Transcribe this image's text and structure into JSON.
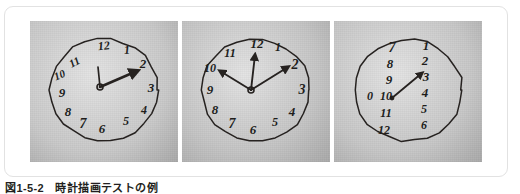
{
  "figure": {
    "caption": "図1-5-2　時計描画テストの例",
    "card_border_color": "#e2e2e2",
    "card_background": "#ffffff",
    "ink_color": "#262220"
  },
  "panels": [
    {
      "id": "clock-drawing-1",
      "label": "clock-drawing-panel-1",
      "description": "手描きの時計 数字が上部左に偏る例",
      "paper_tone": "#c9c9c9",
      "numbers": [
        {
          "text": "12",
          "x": 74,
          "y": 26,
          "size": 12,
          "rot": -6
        },
        {
          "text": "1",
          "x": 97,
          "y": 30,
          "size": 12,
          "rot": -4
        },
        {
          "text": "2",
          "x": 113,
          "y": 44,
          "size": 13,
          "rot": 0
        },
        {
          "text": "3",
          "x": 121,
          "y": 68,
          "size": 13,
          "rot": 0
        },
        {
          "text": "4",
          "x": 114,
          "y": 90,
          "size": 12,
          "rot": 0
        },
        {
          "text": "5",
          "x": 96,
          "y": 101,
          "size": 12,
          "rot": 0
        },
        {
          "text": "6",
          "x": 72,
          "y": 109,
          "size": 13,
          "rot": 0
        },
        {
          "text": "7",
          "x": 53,
          "y": 104,
          "size": 14,
          "rot": 0
        },
        {
          "text": "8",
          "x": 38,
          "y": 92,
          "size": 13,
          "rot": 0
        },
        {
          "text": "9",
          "x": 32,
          "y": 73,
          "size": 13,
          "rot": 0
        },
        {
          "text": "10",
          "x": 30,
          "y": 55,
          "size": 11,
          "rot": -22
        },
        {
          "text": "11",
          "x": 45,
          "y": 42,
          "size": 11,
          "rot": -28
        }
      ],
      "hands": [
        {
          "name": "short-hand",
          "to_x": 68,
          "to_y": 46,
          "width": 1.7,
          "arrow": false
        },
        {
          "name": "long-hand",
          "to_x": 107,
          "to_y": 50,
          "width": 2.6,
          "arrow": true
        }
      ],
      "center": {
        "x": 70,
        "y": 66
      }
    },
    {
      "id": "clock-drawing-2",
      "label": "clock-drawing-panel-2",
      "description": "手描きの時計 3本の針が描かれた例",
      "paper_tone": "#c4c4c4",
      "numbers": [
        {
          "text": "12",
          "x": 75,
          "y": 24,
          "size": 13,
          "rot": 0
        },
        {
          "text": "1",
          "x": 96,
          "y": 27,
          "size": 12,
          "rot": 0
        },
        {
          "text": "2",
          "x": 113,
          "y": 45,
          "size": 14,
          "rot": 0
        },
        {
          "text": "3",
          "x": 120,
          "y": 70,
          "size": 14,
          "rot": 0
        },
        {
          "text": "4",
          "x": 110,
          "y": 92,
          "size": 13,
          "rot": 0
        },
        {
          "text": "5",
          "x": 93,
          "y": 102,
          "size": 12,
          "rot": 0
        },
        {
          "text": "6",
          "x": 71,
          "y": 110,
          "size": 13,
          "rot": 0
        },
        {
          "text": "7",
          "x": 50,
          "y": 104,
          "size": 14,
          "rot": 0
        },
        {
          "text": "8",
          "x": 33,
          "y": 90,
          "size": 13,
          "rot": 0
        },
        {
          "text": "9",
          "x": 28,
          "y": 70,
          "size": 13,
          "rot": 0
        },
        {
          "text": "10",
          "x": 28,
          "y": 48,
          "size": 12,
          "rot": 0
        },
        {
          "text": "11",
          "x": 48,
          "y": 33,
          "size": 12,
          "rot": 0
        }
      ],
      "hands": [
        {
          "name": "hand-to-12",
          "to_x": 73,
          "to_y": 34,
          "width": 1.9,
          "arrow": true
        },
        {
          "name": "hand-to-10",
          "to_x": 38,
          "to_y": 50,
          "width": 1.9,
          "arrow": true
        },
        {
          "name": "hand-to-2",
          "to_x": 106,
          "to_y": 46,
          "width": 2.0,
          "arrow": true
        }
      ],
      "center": {
        "x": 69,
        "y": 69
      }
    },
    {
      "id": "clock-drawing-3",
      "label": "clock-drawing-panel-3",
      "description": "手描きの時計 数字が2列に縦並びになった例",
      "paper_tone": "#c7c7c7",
      "numbers": [
        {
          "text": "7",
          "x": 58,
          "y": 28,
          "size": 14,
          "rot": 0
        },
        {
          "text": "8",
          "x": 56,
          "y": 44,
          "size": 13,
          "rot": 0
        },
        {
          "text": "9",
          "x": 55,
          "y": 60,
          "size": 13,
          "rot": 0
        },
        {
          "text": "0",
          "x": 36,
          "y": 76,
          "size": 12,
          "rot": 0
        },
        {
          "text": "10",
          "x": 52,
          "y": 76,
          "size": 12,
          "rot": 0
        },
        {
          "text": "11",
          "x": 52,
          "y": 93,
          "size": 12,
          "rot": 0
        },
        {
          "text": "12",
          "x": 50,
          "y": 110,
          "size": 12,
          "rot": 0
        },
        {
          "text": "1",
          "x": 92,
          "y": 26,
          "size": 13,
          "rot": 0
        },
        {
          "text": "2",
          "x": 91,
          "y": 41,
          "size": 13,
          "rot": 0
        },
        {
          "text": "3",
          "x": 92,
          "y": 57,
          "size": 13,
          "rot": 0
        },
        {
          "text": "4",
          "x": 91,
          "y": 73,
          "size": 13,
          "rot": 0
        },
        {
          "text": "5",
          "x": 90,
          "y": 89,
          "size": 12,
          "rot": 0
        },
        {
          "text": "6",
          "x": 90,
          "y": 105,
          "size": 12,
          "rot": 0
        }
      ],
      "hands": [
        {
          "name": "single-hand",
          "to_x": 88,
          "to_y": 52,
          "width": 1.8,
          "arrow": true
        }
      ],
      "center": {
        "x": 58,
        "y": 77
      }
    }
  ]
}
